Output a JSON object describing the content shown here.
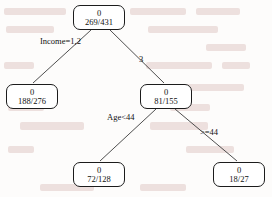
{
  "diagram": {
    "type": "decision-tree",
    "title": "",
    "nodes": [
      {
        "id": "root",
        "class_label": "0",
        "counts": "269/431",
        "x": 73,
        "y": 5,
        "role": "internal",
        "split_variable": "Income"
      },
      {
        "id": "left",
        "class_label": "0",
        "counts": "188/276",
        "x": 6,
        "y": 84,
        "role": "leaf"
      },
      {
        "id": "right",
        "class_label": "0",
        "counts": "81/155",
        "x": 140,
        "y": 84,
        "role": "internal",
        "split_variable": "Age"
      },
      {
        "id": "rleft",
        "class_label": "0",
        "counts": "72/128",
        "x": 73,
        "y": 162,
        "role": "leaf"
      },
      {
        "id": "rright",
        "class_label": "0",
        "counts": "18/27",
        "x": 213,
        "y": 162,
        "role": "leaf"
      }
    ],
    "edges": [
      {
        "from": "root",
        "to": "left",
        "label": "Income=1,2",
        "label_x": 40,
        "label_y": 36
      },
      {
        "from": "root",
        "to": "right",
        "label": "3",
        "label_x": 139,
        "label_y": 54
      },
      {
        "from": "right",
        "to": "rleft",
        "label": "Age<44",
        "label_x": 107,
        "label_y": 112
      },
      {
        "from": "right",
        "to": "rright",
        "label": ">=44",
        "label_x": 200,
        "label_y": 127
      }
    ],
    "colors": {
      "node_border": "#1c1c1c",
      "node_fill": "#ffffff",
      "edge_stroke": "#3b3b3b",
      "text": "#111111",
      "background": "#fdfcfb"
    }
  }
}
